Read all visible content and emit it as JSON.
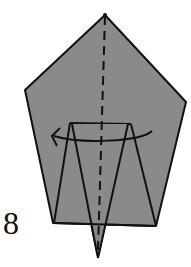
{
  "diagram": {
    "type": "origami-step",
    "step_number": "8",
    "colors": {
      "paper": "#8a8a8a",
      "line": "#111111",
      "background": "#ffffff"
    },
    "elements": {
      "outline": "pentagon-shaped folded paper",
      "center_line": "dashed valley fold line",
      "arrow": "curved arrow indicating turn over / rotate",
      "inner_flap": "narrow triangular flap extending below bottom edge"
    }
  }
}
